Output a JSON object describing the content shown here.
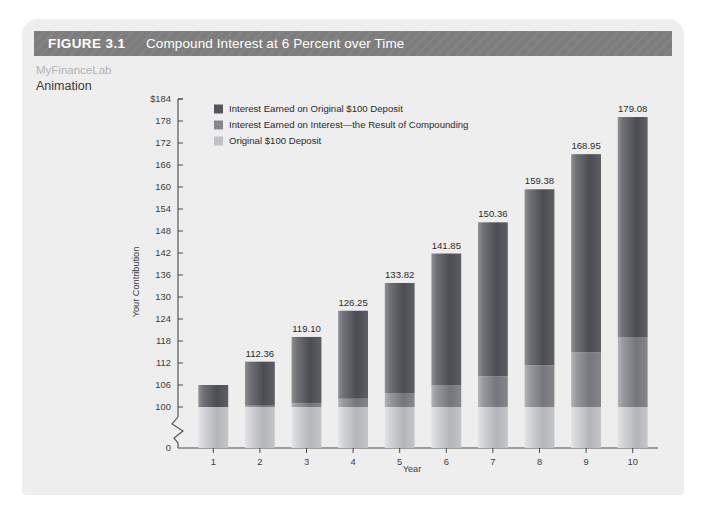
{
  "figure": {
    "number": "FIGURE 3.1",
    "caption": "Compound Interest at 6 Percent over Time"
  },
  "margin_note": {
    "brand": "MyFinanceLab",
    "label": "Animation"
  },
  "colors": {
    "header_bar": "#7d7d7d",
    "card_background": "#eeeeee",
    "segment_interest_on_original": "#54555a",
    "segment_interest_on_interest": "#85878c",
    "segment_original_deposit": "#bfc1c4",
    "axis": "#4a4a4a",
    "text": "#2b2b2b"
  },
  "chart_data": {
    "type": "bar",
    "title": "Compound Interest at 6 Percent over Time",
    "xlabel": "Year",
    "ylabel": "Your Contribution",
    "categories": [
      "1",
      "2",
      "3",
      "4",
      "5",
      "6",
      "7",
      "8",
      "9",
      "10"
    ],
    "values": [
      106.0,
      112.36,
      119.1,
      126.25,
      133.82,
      141.85,
      150.36,
      159.38,
      168.95,
      179.08
    ],
    "data_labels": [
      "",
      "112.36",
      "119.10",
      "126.25",
      "133.82",
      "141.85",
      "150.36",
      "159.38",
      "168.95",
      "179.08"
    ],
    "stacked": true,
    "series": [
      {
        "name": "Original $100 Deposit",
        "color": "#bfc1c4",
        "values": [
          100,
          100,
          100,
          100,
          100,
          100,
          100,
          100,
          100,
          100
        ]
      },
      {
        "name": "Interest Earned on Interest—the Result of Compounding",
        "color": "#85878c",
        "values": [
          0,
          0.36,
          1.1,
          2.25,
          3.82,
          5.85,
          8.36,
          11.38,
          14.95,
          19.08
        ]
      },
      {
        "name": "Interest Earned on Original $100 Deposit",
        "color": "#54555a",
        "values": [
          6,
          12,
          18,
          24,
          30,
          36,
          42,
          48,
          54,
          60
        ]
      }
    ],
    "ylim": [
      100,
      184
    ],
    "yticks": [
      "$184",
      "178",
      "172",
      "166",
      "160",
      "154",
      "148",
      "142",
      "136",
      "130",
      "124",
      "118",
      "112",
      "106",
      "100"
    ],
    "ytick_values": [
      184,
      178,
      172,
      166,
      160,
      154,
      148,
      142,
      136,
      130,
      124,
      118,
      112,
      106,
      100
    ],
    "axis_break": true,
    "zero_tick": "0",
    "grid": false,
    "legend_position": "top-left",
    "legend": [
      "Interest Earned on Original $100 Deposit",
      "Interest Earned on Interest—the Result of Compounding",
      "Original $100 Deposit"
    ]
  }
}
